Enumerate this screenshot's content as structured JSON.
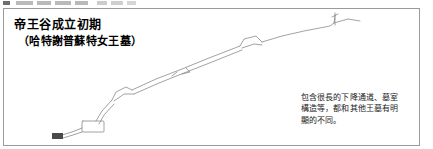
{
  "figure": {
    "title_main": "帝王谷成立初期",
    "title_sub": "（哈特謝普蘇特女王墓）",
    "annotation": {
      "line1": "包含很長的下降通道、墓室",
      "line2": "構造等，都和其他王墓有明",
      "line3": "顯的不同。"
    },
    "colors": {
      "background": "#ffffff",
      "panel_border": "#9a9a9a",
      "drawing_line": "#8a8a8a",
      "title_text": "#000000",
      "annotation_text": "#1a1a1a",
      "top_strip_mark": "#b9b9b9"
    }
  }
}
